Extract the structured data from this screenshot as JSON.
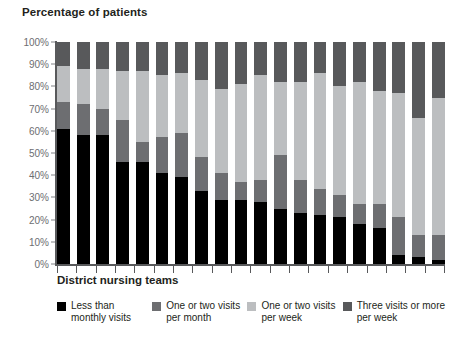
{
  "chart_data": {
    "type": "bar",
    "subtype": "stacked-bar-100-percent",
    "title": "Percentage of patients",
    "xlabel": "District nursing teams",
    "ylabel": "",
    "ylim": [
      0,
      100
    ],
    "ytick_labels": [
      "100%",
      "90%",
      "80%",
      "70%",
      "60%",
      "50%",
      "40%",
      "30%",
      "20%",
      "10%",
      "0%"
    ],
    "ytick_values": [
      100,
      90,
      80,
      70,
      60,
      50,
      40,
      30,
      20,
      10,
      0
    ],
    "grid": false,
    "legend_position": "bottom",
    "categories": [
      "1",
      "2",
      "3",
      "4",
      "5",
      "6",
      "7",
      "8",
      "9",
      "10",
      "11",
      "12",
      "13",
      "14",
      "15",
      "16",
      "17",
      "18",
      "19",
      "20"
    ],
    "series": [
      {
        "name": "Less than monthly visits",
        "color": "#000000",
        "values": [
          61,
          58,
          58,
          46,
          46,
          41,
          39,
          33,
          29,
          29,
          28,
          25,
          23,
          22,
          21,
          18,
          16,
          4,
          3,
          2
        ]
      },
      {
        "name": "One or two visits per month",
        "color": "#6d6e71",
        "values": [
          12,
          14,
          12,
          19,
          9,
          16,
          20,
          15,
          12,
          8,
          10,
          24,
          15,
          12,
          10,
          9,
          11,
          17,
          10,
          11
        ]
      },
      {
        "name": "One or two visits per week",
        "color": "#bcbec0",
        "values": [
          16,
          16,
          18,
          22,
          32,
          28,
          27,
          35,
          38,
          44,
          47,
          33,
          44,
          52,
          49,
          55,
          51,
          56,
          53,
          62
        ]
      },
      {
        "name": "Three visits or more per week",
        "color": "#58595b",
        "values": [
          11,
          12,
          12,
          13,
          13,
          15,
          14,
          17,
          21,
          19,
          15,
          18,
          18,
          14,
          20,
          18,
          22,
          23,
          34,
          25
        ]
      }
    ]
  },
  "legend": {
    "items": [
      {
        "label": "Less than\nmonthly visits",
        "color": "#000000",
        "icon": "square-swatch-icon"
      },
      {
        "label": "One or two visits\nper month",
        "color": "#6d6e71",
        "icon": "square-swatch-icon"
      },
      {
        "label": "One or two visits\nper week",
        "color": "#bcbec0",
        "icon": "square-swatch-icon"
      },
      {
        "label": "Three visits or more\nper week",
        "color": "#58595b",
        "icon": "square-swatch-icon"
      }
    ]
  },
  "colors": {
    "axis": "#58595b",
    "tick_text": "#6d6e71",
    "title_text": "#231f20",
    "background": "#ffffff"
  }
}
